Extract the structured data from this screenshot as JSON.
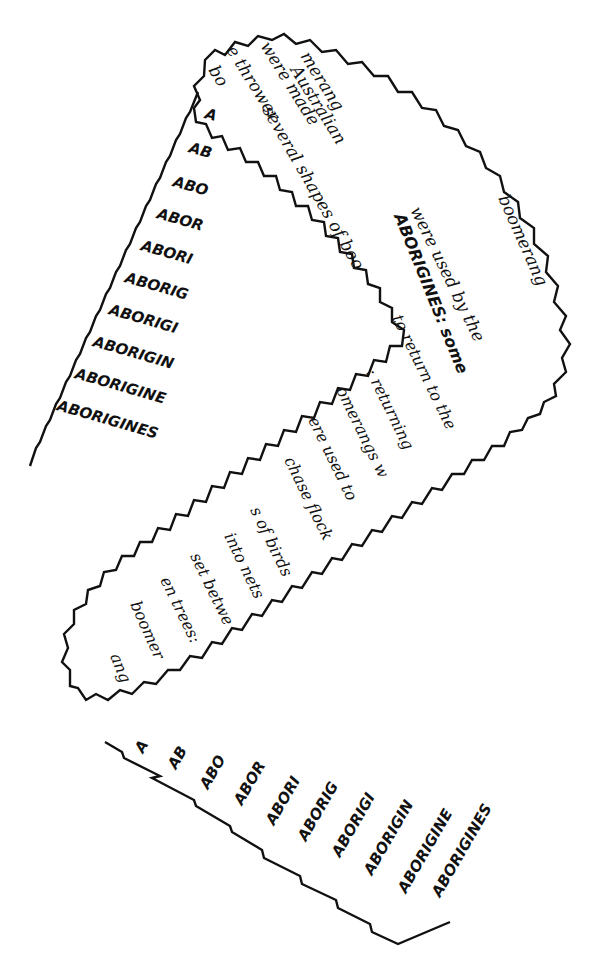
{
  "artwork": {
    "type": "calligraphic concrete poem in boomerang shape",
    "ink_color": "#111111",
    "paper_color": "#ffffff"
  },
  "band_text": [
    "bo",
    "e thrower",
    "were made",
    "Australian",
    "merang",
    "several shapes of boo",
    "boomerang",
    "were used by the",
    "ABORIGINES: some",
    "to return to the",
    ": returning",
    "omerangs w",
    "ere used to",
    "chase flock",
    "s of birds",
    "into nets",
    "set betwe",
    "en trees:",
    "boomer",
    "ang"
  ],
  "staircase_top": [
    "A",
    "AB",
    "ABO",
    "ABOR",
    "ABORI",
    "ABORIG",
    "ABORIGI",
    "ABORIGIN",
    "ABORIGINE",
    "ABORIGINES"
  ],
  "staircase_bottom": [
    "A",
    "AB",
    "ABO",
    "ABOR",
    "ABORI",
    "ABORIG",
    "ABORIGI",
    "ABORIGIN",
    "ABORIGINE",
    "ABORIGINES"
  ]
}
